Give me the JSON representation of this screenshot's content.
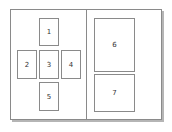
{
  "diagram": {
    "title": "",
    "panels": [
      {
        "name": "left-panel",
        "boxes": [
          {
            "id": "b1",
            "label": "1"
          },
          {
            "id": "b2",
            "label": "2"
          },
          {
            "id": "b3",
            "label": "3"
          },
          {
            "id": "b4",
            "label": "4"
          },
          {
            "id": "b5",
            "label": "5"
          }
        ]
      },
      {
        "name": "right-panel",
        "boxes": [
          {
            "id": "b6",
            "label": "6"
          },
          {
            "id": "b7",
            "label": "7"
          }
        ]
      }
    ]
  }
}
